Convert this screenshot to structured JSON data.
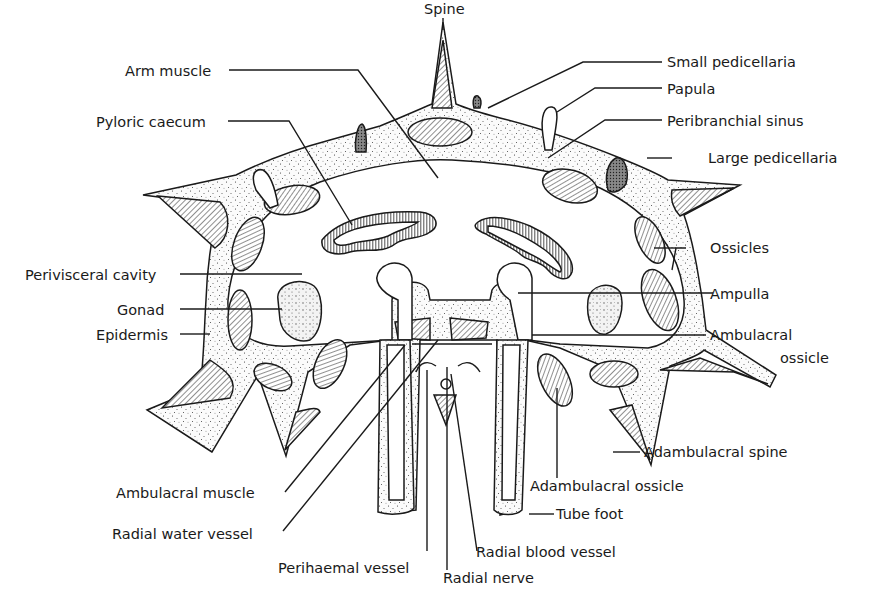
{
  "diagram": {
    "labels": {
      "spine": "Spine",
      "arm_muscle": "Arm muscle",
      "small_pedicellaria": "Small pedicellaria",
      "papula": "Papula",
      "pyloric_caecum": "Pyloric caecum",
      "peribranchial_sinus": "Peribranchial sinus",
      "large_pedicellaria": "Large pedicellaria",
      "ossicles": "Ossicles",
      "perivisceral_cavity": "Perivisceral cavity",
      "ampulla": "Ampulla",
      "gonad": "Gonad",
      "epidermis": "Epidermis",
      "ambulacral_ossicle_1": "Ambulacral",
      "ambulacral_ossicle_2": "ossicle",
      "adambulacral_spine": "Adambulacral spine",
      "ambulacral_muscle": "Ambulacral muscle",
      "adambulacral_ossicle": "Adambulacral ossicle",
      "radial_water_vessel": "Radial water vessel",
      "tube_foot": "Tube foot",
      "radial_blood_vessel": "Radial blood vessel",
      "perihaemal_vessel": "Perihaemal vessel",
      "radial_nerve": "Radial nerve"
    },
    "colors": {
      "ink": "#1a1a1a",
      "background": "#ffffff",
      "tissue": "#f4f4f4"
    }
  }
}
